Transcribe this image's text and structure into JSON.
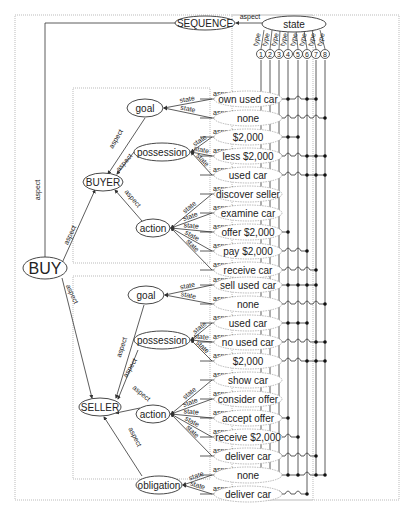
{
  "diagram": {
    "root": "BUY",
    "sequence_node": "SEQUENCE",
    "state_node": "state",
    "edge_labels": {
      "aspect": "aspect",
      "state": "state",
      "type": "type"
    },
    "type_columns": [
      "1",
      "2",
      "3",
      "4",
      "5",
      "6",
      "7",
      "8"
    ],
    "buyer": {
      "label": "BUYER",
      "goal": {
        "label": "goal",
        "states": [
          "own used car",
          "none"
        ]
      },
      "possession": {
        "label": "possession",
        "states": [
          "$2,000",
          "less $2,000",
          "used car"
        ]
      },
      "action": {
        "label": "action",
        "states": [
          "discover seller",
          "examine car",
          "offer $2,000",
          "pay $2,000",
          "receive car"
        ]
      }
    },
    "seller": {
      "label": "SELLER",
      "goal": {
        "label": "goal",
        "states": [
          "sell used car",
          "none"
        ]
      },
      "possession": {
        "label": "possession",
        "states": [
          "used car",
          "no used car",
          "$2,000"
        ]
      },
      "action": {
        "label": "action",
        "states": [
          "show car",
          "consider offer",
          "accept offer",
          "receive $2,000",
          "deliver car"
        ]
      },
      "obligation": {
        "label": "obligation",
        "states": [
          "none",
          "deliver car"
        ]
      }
    },
    "matrix_rows": [
      {
        "state": "own used car",
        "dots": [
          1,
          2,
          3,
          4,
          6,
          7
        ]
      },
      {
        "state": "none",
        "dots": [
          8
        ]
      },
      {
        "state": "$2,000",
        "dots": [
          1,
          2,
          3,
          4,
          5
        ]
      },
      {
        "state": "less $2,000",
        "dots": [
          6,
          7,
          8
        ]
      },
      {
        "state": "used car",
        "dots": [
          6,
          7,
          8
        ]
      },
      {
        "state": "discover seller",
        "dots": [
          2
        ]
      },
      {
        "state": "examine car",
        "dots": [
          3
        ]
      },
      {
        "state": "offer $2,000",
        "dots": [
          4
        ]
      },
      {
        "state": "pay $2,000",
        "dots": [
          6
        ]
      },
      {
        "state": "receive car",
        "dots": [
          7
        ]
      },
      {
        "state": "sell used car",
        "dots": [
          1,
          2,
          3,
          4,
          5,
          6,
          7
        ]
      },
      {
        "state": "none",
        "dots": [
          8
        ]
      },
      {
        "state": "used car",
        "dots": [
          1,
          2,
          3,
          4,
          5,
          6
        ]
      },
      {
        "state": "no used car",
        "dots": [
          7,
          8
        ]
      },
      {
        "state": "$2,000",
        "dots": [
          6,
          7,
          8
        ]
      },
      {
        "state": "show car",
        "dots": [
          1
        ]
      },
      {
        "state": "consider offer",
        "dots": [
          3
        ]
      },
      {
        "state": "accept offer",
        "dots": [
          4
        ]
      },
      {
        "state": "receive $2,000",
        "dots": [
          5
        ]
      },
      {
        "state": "deliver car",
        "dots": [
          7
        ]
      },
      {
        "state": "none",
        "dots": [
          1,
          2,
          3,
          4,
          5,
          7,
          8
        ]
      },
      {
        "state": "deliver car",
        "dots": [
          6
        ]
      }
    ]
  }
}
